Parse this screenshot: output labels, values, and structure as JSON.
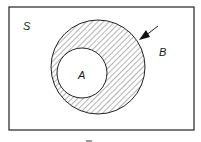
{
  "diagram": {
    "type": "venn",
    "universe_label": "S",
    "sets": [
      {
        "name": "B",
        "label": "B",
        "shaded": true,
        "role": "outer"
      },
      {
        "name": "A",
        "label": "A",
        "shaded": false,
        "role": "inner, subset of B"
      }
    ],
    "shaded_region": "B minus A",
    "pointer": "arrow pointing to shaded region",
    "caption": "—"
  },
  "colors": {
    "stroke": "#222222",
    "hatch": "#444444",
    "background": "#ffffff"
  }
}
